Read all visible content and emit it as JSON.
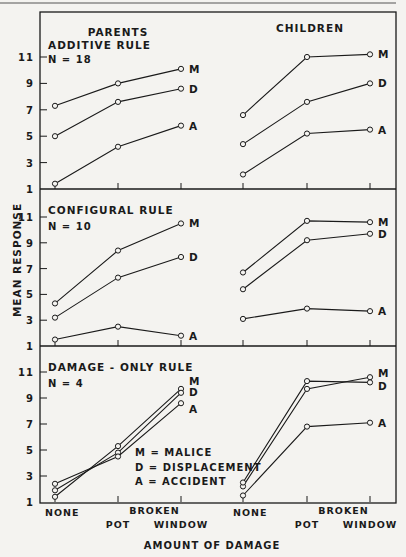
{
  "chart_data": {
    "type": "line",
    "ylabel": "MEAN RESPONSE",
    "xlabel": "AMOUNT OF DAMAGE",
    "column_titles": [
      "PARENTS",
      "CHILDREN"
    ],
    "x_categories": [
      "NONE",
      "BROKEN POT",
      "BROKEN WINDOW"
    ],
    "x_tick_labels": {
      "none": "NONE",
      "broken": "BROKEN",
      "pot": "POT",
      "window": "WINDOW"
    },
    "y_ticks": [
      1,
      3,
      5,
      7,
      9,
      11
    ],
    "ylim": [
      1,
      11
    ],
    "legend": [
      {
        "key": "M",
        "text": "M = MALICE"
      },
      {
        "key": "D",
        "text": "D = DISPLACEMENT"
      },
      {
        "key": "A",
        "text": "A = ACCIDENT"
      }
    ],
    "panels": [
      {
        "rule": "ADDITIVE RULE",
        "n": "N = 18",
        "parents": {
          "M": [
            7.3,
            9.0,
            10.1
          ],
          "D": [
            5.0,
            7.6,
            8.6
          ],
          "A": [
            1.4,
            4.2,
            5.8
          ]
        },
        "children": {
          "M": [
            6.6,
            11.0,
            11.2
          ],
          "D": [
            4.4,
            7.6,
            9.0
          ],
          "A": [
            2.1,
            5.2,
            5.5
          ]
        }
      },
      {
        "rule": "CONFIGURAL RULE",
        "n": "N = 10",
        "parents": {
          "M": [
            4.3,
            8.4,
            10.5
          ],
          "D": [
            3.2,
            6.3,
            7.9
          ],
          "A": [
            1.5,
            2.5,
            1.8
          ]
        },
        "children": {
          "M": [
            6.7,
            10.7,
            10.6
          ],
          "D": [
            5.4,
            9.2,
            9.7
          ],
          "A": [
            3.1,
            3.9,
            3.7
          ]
        }
      },
      {
        "rule": "DAMAGE - ONLY RULE",
        "n": "N = 4",
        "parents": {
          "M": [
            1.4,
            5.3,
            9.7
          ],
          "D": [
            1.9,
            4.8,
            9.4
          ],
          "A": [
            2.4,
            4.5,
            8.6
          ]
        },
        "children": {
          "M": [
            2.2,
            9.7,
            10.6
          ],
          "D": [
            2.5,
            10.3,
            10.2
          ],
          "A": [
            1.5,
            6.8,
            7.1
          ]
        }
      }
    ]
  }
}
